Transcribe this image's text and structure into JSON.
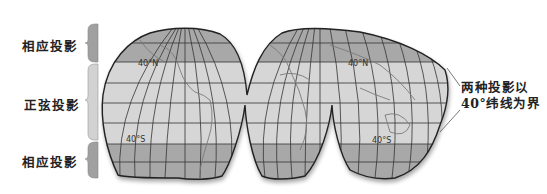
{
  "diagram": {
    "type": "Goode homolosine interrupted world map projection",
    "bands": [
      {
        "label": "相应投影",
        "region": "north-high-latitude",
        "fill": "#9c9c9c"
      },
      {
        "label": "正弦投影",
        "region": "equatorial",
        "fill": "#c8c8c8"
      },
      {
        "label": "相应投影",
        "region": "south-high-latitude",
        "fill": "#9c9c9c"
      }
    ],
    "latitude_labels": {
      "left_north": "40°N",
      "left_south": "40°S",
      "right_north": "40°N",
      "right_south": "40°S"
    },
    "annotation": {
      "line1": "两种投影以",
      "line2": "40°纬线为界"
    },
    "colors": {
      "high_lat_fill": "#a6a6a6",
      "mid_lat_fill": "#d4d4d4",
      "outline": "#2a2a2a",
      "grid": "#3a3a3a"
    }
  }
}
